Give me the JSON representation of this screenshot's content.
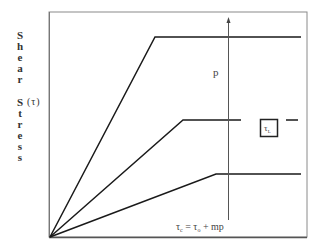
{
  "diagram": {
    "y_axis_label": {
      "word1": [
        "S",
        "h",
        "e",
        "a",
        "r"
      ],
      "word2": [
        "S",
        "t",
        "r",
        "e",
        "s",
        "s"
      ],
      "symbol": "(τ)"
    },
    "arrow_label": "p",
    "box_label": "τ",
    "box_label_sub": "L",
    "equation": {
      "lhs": "τ",
      "lhs_sub": "c",
      "eq": " = ",
      "rhs1": "τ",
      "rhs1_sub": "o",
      "rhs2": " + mp"
    },
    "lines": [
      {
        "name": "high-p curve",
        "points": [
          [
            50,
            237
          ],
          [
            155,
            37
          ],
          [
            301,
            37
          ]
        ]
      },
      {
        "name": "medium-p curve",
        "points": [
          [
            50,
            237
          ],
          [
            183,
            120
          ],
          [
            241,
            120
          ]
        ],
        "dash": [
          [
            286,
            120
          ],
          [
            298,
            120
          ]
        ]
      },
      {
        "name": "low-p curve",
        "points": [
          [
            50,
            237
          ],
          [
            216,
            174
          ],
          [
            301,
            174
          ]
        ]
      }
    ],
    "colors": {
      "line": "#1a1a1a",
      "frame": "#8a8a8a",
      "text": "#444444"
    }
  }
}
